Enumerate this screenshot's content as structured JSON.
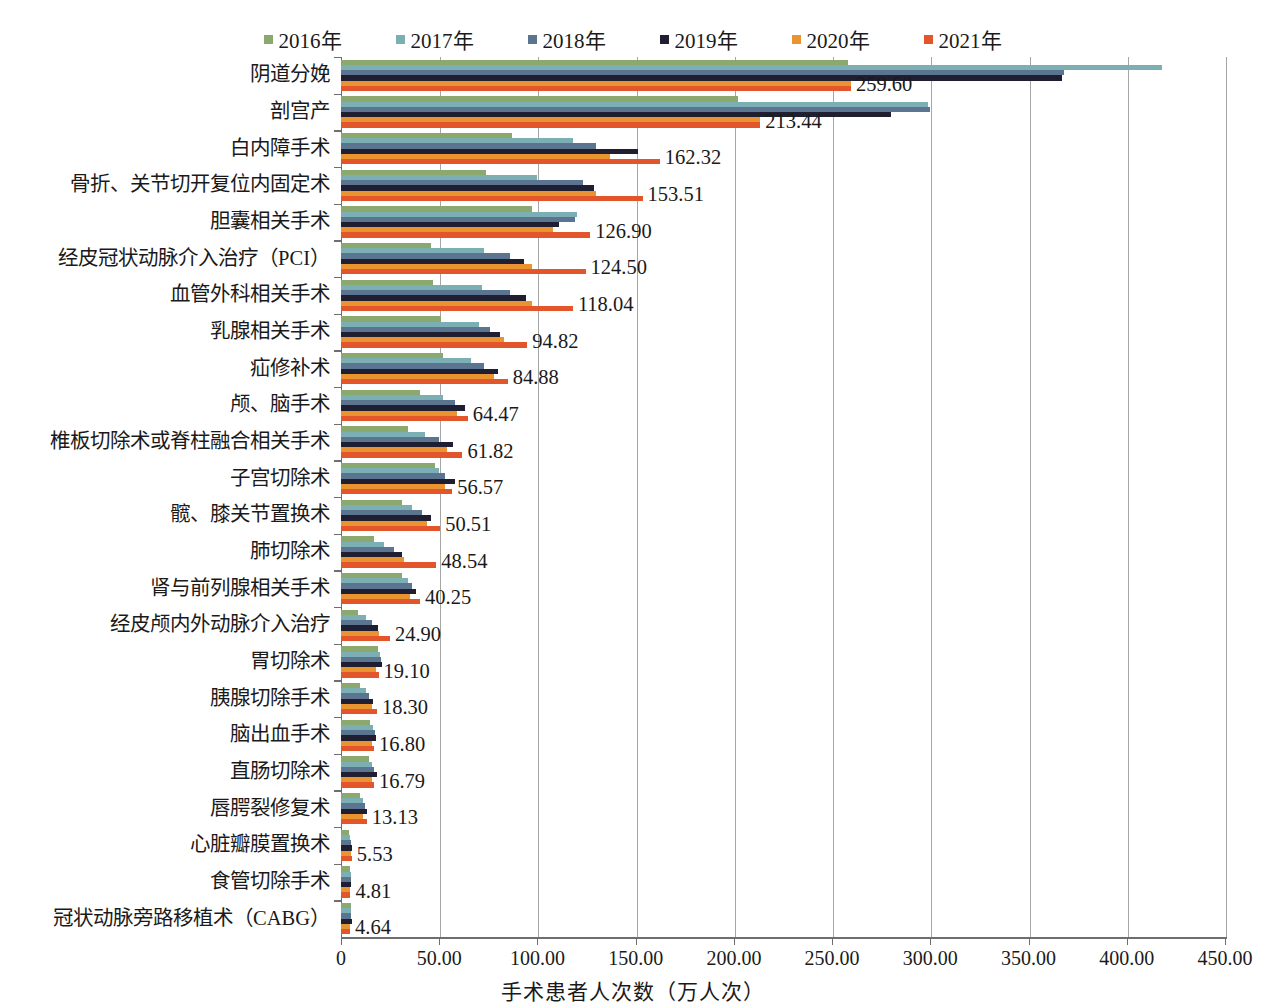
{
  "legend": {
    "items": [
      {
        "label": "2016年",
        "color": "#8BA96F"
      },
      {
        "label": "2017年",
        "color": "#7BAFB3"
      },
      {
        "label": "2018年",
        "color": "#5B7591"
      },
      {
        "label": "2019年",
        "color": "#201F31"
      },
      {
        "label": "2020年",
        "color": "#E99431"
      },
      {
        "label": "2021年",
        "color": "#E3552A"
      }
    ]
  },
  "axis": {
    "x_title": "手术患者人次数（万人次）",
    "x_ticks": [
      "0",
      "50.00",
      "100.00",
      "150.00",
      "200.00",
      "250.00",
      "300.00",
      "350.00",
      "400.00",
      "450.00"
    ]
  },
  "chart_data": {
    "type": "bar",
    "orientation": "horizontal",
    "title": "",
    "xlabel": "手术患者人次数（万人次）",
    "ylabel": "",
    "xlim": [
      0,
      450
    ],
    "xticks": [
      0,
      50,
      100,
      150,
      200,
      250,
      300,
      350,
      400,
      450
    ],
    "grid": true,
    "legend_position": "top",
    "series_names": [
      "2016年",
      "2017年",
      "2018年",
      "2019年",
      "2020年",
      "2021年"
    ],
    "series_colors": [
      "#8BA96F",
      "#7BAFB3",
      "#5B7591",
      "#201F31",
      "#E99431",
      "#E3552A"
    ],
    "label_series": "2021年",
    "categories": [
      "阴道分娩",
      "剖宫产",
      "白内障手术",
      "骨折、关节切开复位内固定术",
      "胆囊相关手术",
      "经皮冠状动脉介入治疗（PCI）",
      "血管外科相关手术",
      "乳腺相关手术",
      "疝修补术",
      "颅、脑手术",
      "椎板切除术或脊柱融合相关手术",
      "子宫切除术",
      "髋、膝关节置换术",
      "肺切除术",
      "肾与前列腺相关手术",
      "经皮颅内外动脉介入治疗",
      "胃切除术",
      "胰腺切除手术",
      "脑出血手术",
      "直肠切除术",
      "唇腭裂修复术",
      "心脏瓣膜置换术",
      "食管切除手术",
      "冠状动脉旁路移植术（CABG）"
    ],
    "series": [
      {
        "name": "2016年",
        "values": [
          258.0,
          202.0,
          87.0,
          74.0,
          97.0,
          46.0,
          47.0,
          51.0,
          52.0,
          40.0,
          34.0,
          48.0,
          31.0,
          17.0,
          31.0,
          8.5,
          19.0,
          9.5,
          15.0,
          14.5,
          9.5,
          4.0,
          4.5,
          4.9
        ]
      },
      {
        "name": "2017年",
        "values": [
          418.0,
          299.0,
          118.0,
          100.0,
          120.0,
          73.0,
          72.0,
          70.0,
          66.0,
          52.0,
          43.0,
          50.0,
          36.0,
          22.0,
          34.0,
          12.5,
          20.0,
          12.5,
          16.5,
          16.0,
          11.0,
          4.5,
          4.9,
          5.1
        ]
      },
      {
        "name": "2018年",
        "values": [
          368.0,
          300.0,
          130.0,
          123.0,
          119.0,
          86.0,
          86.0,
          76.0,
          73.0,
          58.0,
          50.0,
          53.0,
          41.0,
          27.0,
          36.0,
          16.0,
          20.5,
          14.5,
          17.5,
          17.0,
          12.0,
          5.0,
          5.0,
          5.3
        ]
      },
      {
        "name": "2019年",
        "values": [
          367.0,
          280.0,
          151.0,
          129.0,
          111.0,
          93.0,
          94.0,
          81.0,
          80.0,
          63.0,
          57.0,
          58.0,
          46.0,
          31.0,
          38.0,
          19.0,
          21.0,
          16.5,
          18.0,
          18.5,
          13.0,
          5.4,
          5.2,
          5.5
        ]
      },
      {
        "name": "2020年",
        "values": [
          259.6,
          213.44,
          137.0,
          130.0,
          108.0,
          97.0,
          97.0,
          83.0,
          78.0,
          59.0,
          54.0,
          53.0,
          44.0,
          32.0,
          35.0,
          19.5,
          18.0,
          16.0,
          16.0,
          16.0,
          11.0,
          4.9,
          4.6,
          4.4
        ]
      },
      {
        "name": "2021年",
        "values": [
          259.6,
          213.44,
          162.32,
          153.51,
          126.9,
          124.5,
          118.04,
          94.82,
          84.88,
          64.47,
          61.82,
          56.57,
          50.51,
          48.54,
          40.25,
          24.9,
          19.1,
          18.3,
          16.8,
          16.79,
          13.13,
          5.53,
          4.81,
          4.64
        ]
      }
    ],
    "data_labels": [
      "259.60",
      "213.44",
      "162.32",
      "153.51",
      "126.90",
      "124.50",
      "118.04",
      "94.82",
      "84.88",
      "64.47",
      "61.82",
      "56.57",
      "50.51",
      "48.54",
      "40.25",
      "24.90",
      "19.10",
      "18.30",
      "16.80",
      "16.79",
      "13.13",
      "5.53",
      "4.81",
      "4.64"
    ]
  }
}
